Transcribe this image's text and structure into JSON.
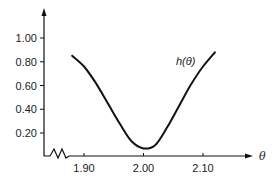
{
  "chart_data": {
    "type": "line",
    "title": "",
    "xlabel": "θ",
    "ylabel": "",
    "curve_label": "h(θ)",
    "x_ticks": [
      1.9,
      2.0,
      2.1
    ],
    "x_tick_labels": [
      "1.90",
      "2.00",
      "2.10"
    ],
    "y_ticks": [
      0.2,
      0.4,
      0.6,
      0.8,
      1.0
    ],
    "y_tick_labels": [
      "0.20",
      "0.40",
      "0.60",
      "0.80",
      "1.00"
    ],
    "xlim": [
      1.85,
      2.18
    ],
    "ylim": [
      0.0,
      1.2
    ],
    "grid": false,
    "legend": "none",
    "x_axis_break": true,
    "series": [
      {
        "name": "h(θ)",
        "x": [
          1.88,
          1.9,
          1.92,
          1.94,
          1.96,
          1.98,
          2.0,
          2.02,
          2.04,
          2.06,
          2.08,
          2.1,
          2.12
        ],
        "values": [
          0.85,
          0.76,
          0.62,
          0.45,
          0.28,
          0.13,
          0.07,
          0.1,
          0.25,
          0.43,
          0.61,
          0.76,
          0.88
        ]
      }
    ]
  }
}
